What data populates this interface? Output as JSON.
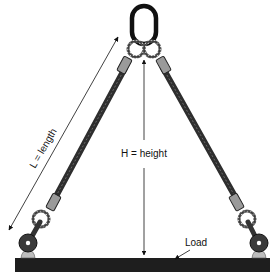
{
  "diagram": {
    "labels": {
      "length": "L = length",
      "height": "H = height",
      "load": "Load"
    },
    "colors": {
      "rope": "#3a3a3a",
      "ring": "#111111",
      "load": "#1e1e1e",
      "sleeve": "#9a9a9a",
      "pad": "#bdbdbd",
      "arrow": "#111111"
    },
    "components": [
      "master-link",
      "left-leg",
      "right-leg",
      "left-hook",
      "right-hook",
      "load-beam"
    ]
  }
}
